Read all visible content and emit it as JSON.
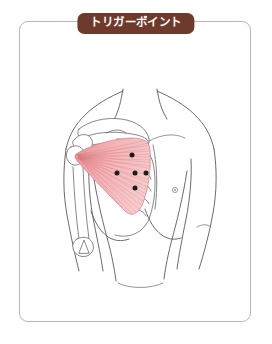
{
  "panel": {
    "title": "トリガーポイント",
    "border_color": "#c9b2ae",
    "badge_color": "#6e3a2c",
    "badge_text_color": "#ffffff",
    "background_color": "#ffffff"
  },
  "illustration": {
    "subject": "human-upper-torso-anterior-view",
    "alt_text": "上半身前面の解剖図",
    "line_color": "#5a5a5a",
    "muscle": {
      "name": "小胸筋",
      "fill_color": "#f3b8ba",
      "hatch_color": "#d4767e",
      "outline_color": "#d07f84"
    },
    "trigger_points": {
      "label": "トリガーポイント",
      "color": "#1c1c1c",
      "count": 5,
      "points": [
        {
          "id": "tp-1",
          "cx": 113,
          "cy": 134,
          "r": 2.5
        },
        {
          "id": "tp-2",
          "cx": 98,
          "cy": 152,
          "r": 2.5
        },
        {
          "id": "tp-3",
          "cx": 116,
          "cy": 152,
          "r": 2.5
        },
        {
          "id": "tp-4",
          "cx": 116,
          "cy": 167,
          "r": 2.5
        },
        {
          "id": "tp-5",
          "cx": 127,
          "cy": 152,
          "r": 2.5
        }
      ]
    },
    "landmarks": [
      {
        "id": "neck",
        "label": "頸部"
      },
      {
        "id": "clavicle",
        "label": "鎖骨"
      },
      {
        "id": "scapula",
        "label": "肩甲骨"
      },
      {
        "id": "ribcage",
        "label": "肋骨"
      },
      {
        "id": "humerus",
        "label": "上腕骨"
      },
      {
        "id": "elbow",
        "label": "肘"
      },
      {
        "id": "breast-right",
        "label": "右乳房"
      },
      {
        "id": "nipple-right",
        "label": "乳頭"
      }
    ]
  }
}
